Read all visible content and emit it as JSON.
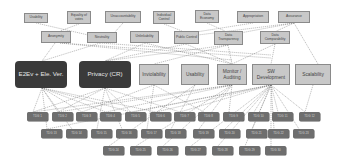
{
  "diagram": {
    "top_requirements": [
      {
        "label": "Usability",
        "x": 24,
        "y": 13,
        "w": 24,
        "h": 10
      },
      {
        "label": "Equality of votes",
        "x": 67,
        "y": 11,
        "w": 24,
        "h": 13
      },
      {
        "label": "Unaccountability",
        "x": 105,
        "y": 11,
        "w": 36,
        "h": 12
      },
      {
        "label": "Individual Control",
        "x": 153,
        "y": 11,
        "w": 22,
        "h": 13
      },
      {
        "label": "Data Economy",
        "x": 195,
        "y": 10,
        "w": 24,
        "h": 13
      },
      {
        "label": "Appropriation",
        "x": 237,
        "y": 11,
        "w": 32,
        "h": 12
      },
      {
        "label": "Assurance",
        "x": 278,
        "y": 11,
        "w": 32,
        "h": 12
      }
    ],
    "second_requirements": [
      {
        "label": "Anonymity",
        "x": 41,
        "y": 31,
        "w": 30,
        "h": 12
      },
      {
        "label": "Neutrality",
        "x": 87,
        "y": 32,
        "w": 30,
        "h": 11
      },
      {
        "label": "Unlinkability",
        "x": 130,
        "y": 31,
        "w": 29,
        "h": 12
      },
      {
        "label": "Public Control",
        "x": 174,
        "y": 31,
        "w": 25,
        "h": 13
      },
      {
        "label": "Data Transparency",
        "x": 214,
        "y": 31,
        "w": 29,
        "h": 14
      },
      {
        "label": "Data Comparability",
        "x": 260,
        "y": 31,
        "w": 30,
        "h": 13
      }
    ],
    "main_goals": [
      {
        "label": "E2Ev + Ele. Ver.",
        "x": 15,
        "y": 61,
        "w": 52,
        "h": 27,
        "kind": "goal"
      },
      {
        "label": "Privacy (CR)",
        "x": 79,
        "y": 61,
        "w": 52,
        "h": 27,
        "kind": "goal"
      },
      {
        "label": "Inviolability",
        "x": 139,
        "y": 64,
        "w": 30,
        "h": 21,
        "kind": "req"
      },
      {
        "label": "Usability",
        "x": 181,
        "y": 64,
        "w": 28,
        "h": 21,
        "kind": "req"
      },
      {
        "label": "Monitor / Auditing",
        "x": 217,
        "y": 64,
        "w": 30,
        "h": 21,
        "kind": "req"
      },
      {
        "label": "SW Development",
        "x": 252,
        "y": 64,
        "w": 38,
        "h": 21,
        "kind": "req"
      },
      {
        "label": "Scalability",
        "x": 295,
        "y": 64,
        "w": 36,
        "h": 21,
        "kind": "req"
      }
    ],
    "task_row_1": [
      {
        "label": "TDG 1",
        "x": 27,
        "y": 112
      },
      {
        "label": "TDG 2",
        "x": 52,
        "y": 112
      },
      {
        "label": "TDG 3",
        "x": 76,
        "y": 112
      },
      {
        "label": "TDG 4",
        "x": 100,
        "y": 112
      },
      {
        "label": "TDG 5",
        "x": 125,
        "y": 112
      },
      {
        "label": "TDG 6",
        "x": 150,
        "y": 112
      },
      {
        "label": "TDG 7",
        "x": 174,
        "y": 112
      },
      {
        "label": "TDG 8",
        "x": 198,
        "y": 112
      },
      {
        "label": "TDG 9",
        "x": 223,
        "y": 112
      },
      {
        "label": "TDG 10",
        "x": 248,
        "y": 112
      },
      {
        "label": "TDG 11",
        "x": 272,
        "y": 112
      },
      {
        "label": "TDG 12",
        "x": 299,
        "y": 112
      }
    ],
    "task_row_2": [
      {
        "label": "TDG 13",
        "x": 41,
        "y": 129
      },
      {
        "label": "TDG 14",
        "x": 66,
        "y": 129
      },
      {
        "label": "TDG 15",
        "x": 91,
        "y": 129
      },
      {
        "label": "TDG 16",
        "x": 116,
        "y": 129
      },
      {
        "label": "TDG 17",
        "x": 141,
        "y": 129
      },
      {
        "label": "TDG 18",
        "x": 165,
        "y": 129
      },
      {
        "label": "TDG 19",
        "x": 193,
        "y": 129
      },
      {
        "label": "TDG 20",
        "x": 219,
        "y": 129
      },
      {
        "label": "TDG 21",
        "x": 246,
        "y": 129
      },
      {
        "label": "TDG 22",
        "x": 268,
        "y": 129
      },
      {
        "label": "TDG 23",
        "x": 293,
        "y": 129
      }
    ],
    "task_row_3": [
      {
        "label": "TDG 24",
        "x": 103,
        "y": 146
      },
      {
        "label": "TDG 25",
        "x": 130,
        "y": 146
      },
      {
        "label": "TDG 26",
        "x": 157,
        "y": 146
      },
      {
        "label": "TDG 27",
        "x": 185,
        "y": 146
      },
      {
        "label": "TDG 28",
        "x": 212,
        "y": 146
      },
      {
        "label": "TDG 29",
        "x": 239,
        "y": 146
      },
      {
        "label": "TDG 30",
        "x": 265,
        "y": 146
      }
    ],
    "colors": {
      "requirement_fill": "#c8c8c8",
      "requirement_border": "#8a8a8a",
      "goal_fill": "#3a3a3a",
      "task_fill": "#6e6e6e",
      "edge": "#777777"
    }
  }
}
